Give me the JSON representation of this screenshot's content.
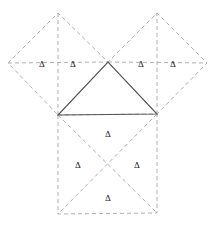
{
  "figure": {
    "background_color": "#ffffff",
    "width": 219,
    "height": 225,
    "solid_stroke_color": "#555555",
    "dashed_stroke_color": "#b0b0b0",
    "label_color": "#1a1a1a",
    "delta_symbol": "Δ",
    "triangle": {
      "name": "central-right-triangle",
      "stroke": "solid",
      "vertices": [
        {
          "label": "left-vertex",
          "x": 58,
          "y": 115
        },
        {
          "label": "right-vertex",
          "x": 157,
          "y": 114
        },
        {
          "label": "apex-vertex",
          "x": 108,
          "y": 62
        }
      ]
    },
    "squares": [
      {
        "name": "left-square-on-leg",
        "orientation": "rotated-45",
        "stroke": "dashed",
        "diagonals": true,
        "vertices": [
          {
            "x": 58,
            "y": 115
          },
          {
            "x": 108,
            "y": 62
          },
          {
            "x": 58,
            "y": 13
          },
          {
            "x": 8,
            "y": 63
          }
        ]
      },
      {
        "name": "right-square-on-leg",
        "orientation": "rotated-45",
        "stroke": "dashed",
        "diagonals": true,
        "vertices": [
          {
            "x": 157,
            "y": 114
          },
          {
            "x": 108,
            "y": 62
          },
          {
            "x": 157,
            "y": 13
          },
          {
            "x": 207,
            "y": 63
          }
        ]
      },
      {
        "name": "bottom-square-on-hypotenuse",
        "orientation": "axis-aligned",
        "stroke": "dashed",
        "diagonals": true,
        "vertices": [
          {
            "x": 58,
            "y": 115
          },
          {
            "x": 157,
            "y": 114
          },
          {
            "x": 157,
            "y": 213
          },
          {
            "x": 58,
            "y": 214
          }
        ]
      }
    ],
    "labels": [
      {
        "name": "delta-left-square-outer",
        "text": "Δ",
        "x": 42,
        "y": 64
      },
      {
        "name": "delta-left-square-inner",
        "text": "Δ",
        "x": 73,
        "y": 64
      },
      {
        "name": "delta-right-square-inner",
        "text": "Δ",
        "x": 141,
        "y": 64
      },
      {
        "name": "delta-right-square-outer",
        "text": "Δ",
        "x": 173,
        "y": 64
      },
      {
        "name": "delta-bottom-square-top",
        "text": "Δ",
        "x": 108,
        "y": 134
      },
      {
        "name": "delta-bottom-square-left",
        "text": "Δ",
        "x": 78,
        "y": 165
      },
      {
        "name": "delta-bottom-square-right",
        "text": "Δ",
        "x": 137,
        "y": 165
      },
      {
        "name": "delta-bottom-square-bottom",
        "text": "Δ",
        "x": 108,
        "y": 198
      }
    ]
  }
}
